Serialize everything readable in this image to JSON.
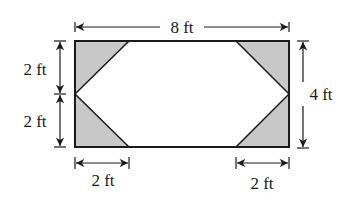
{
  "figure": {
    "colors": {
      "stroke": "#1a1a1a",
      "shade": "#c8c8c8",
      "background": "#ffffff"
    },
    "labels": {
      "top_width": "8 ft",
      "left_upper": "2 ft",
      "left_lower": "2 ft",
      "right_height": "4 ft",
      "bottom_left": "2 ft",
      "bottom_right": "2 ft"
    },
    "rectangle": {
      "width_ft": 8,
      "height_ft": 4
    },
    "shaded_corner_triangles": 4,
    "triangle_legs_ft": {
      "horizontal": 2,
      "vertical": 2
    }
  }
}
